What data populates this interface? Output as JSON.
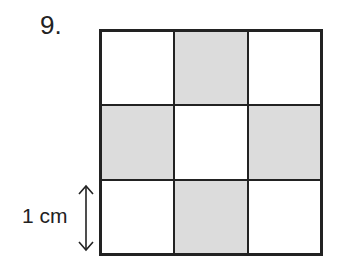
{
  "problem": {
    "number": "9."
  },
  "figure": {
    "type": "grid",
    "rows": 3,
    "columns": 3,
    "cells": [
      {
        "row": 0,
        "col": 0,
        "shaded": false
      },
      {
        "row": 0,
        "col": 1,
        "shaded": true
      },
      {
        "row": 0,
        "col": 2,
        "shaded": false
      },
      {
        "row": 1,
        "col": 0,
        "shaded": true
      },
      {
        "row": 1,
        "col": 1,
        "shaded": false
      },
      {
        "row": 1,
        "col": 2,
        "shaded": true
      },
      {
        "row": 2,
        "col": 0,
        "shaded": false
      },
      {
        "row": 2,
        "col": 1,
        "shaded": true
      },
      {
        "row": 2,
        "col": 2,
        "shaded": false
      }
    ],
    "shade_color": "#dcdcdc",
    "line_color": "#222222"
  },
  "dimension": {
    "label": "1 cm",
    "icon": "double-headed-vertical-arrow"
  }
}
